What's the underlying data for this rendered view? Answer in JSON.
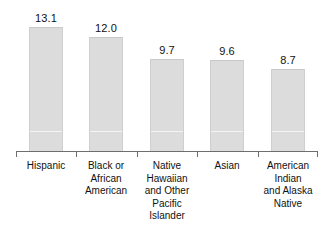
{
  "chart_data": {
    "type": "bar",
    "title": "",
    "subtitle": "",
    "xlabel": "",
    "ylabel": "",
    "ylim": [
      0,
      15.5
    ],
    "grid": false,
    "legend": "none",
    "value_label_format": "one-decimal",
    "categories": [
      "Hispanic",
      "Black or African American",
      "Native Hawaiian and Other Pacific Islander",
      "Asian",
      "American Indian and Alaska Native"
    ],
    "category_label_lines": [
      [
        "Hispanic"
      ],
      [
        "Black or",
        "African",
        "American"
      ],
      [
        "Native",
        "Hawaiian",
        "and Other",
        "Pacific",
        "Islander"
      ],
      [
        "Asian"
      ],
      [
        "American",
        "Indian",
        "and Alaska",
        "Native"
      ]
    ],
    "values": [
      13.1,
      12.0,
      9.7,
      9.6,
      8.7
    ],
    "value_labels": [
      "13.1",
      "12.0",
      "9.7",
      "9.6",
      "8.7"
    ],
    "colors": {
      "bar_fill": "#dcdcdc",
      "bar_border": "#cfcfcf",
      "axis": "#6e6e6e",
      "text": "#111111",
      "background": "#ffffff",
      "gridline": "#f4f4f4"
    }
  }
}
